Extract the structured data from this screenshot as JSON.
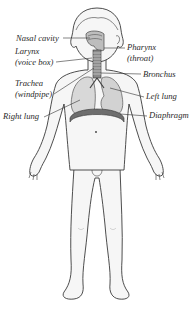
{
  "diagram": {
    "labels": {
      "nasal_cavity": "Nasal cavity",
      "larynx": "Larynx",
      "larynx_common": "(voice box)",
      "pharynx": "Pharynx",
      "pharynx_common": "(throat)",
      "bronchus": "Bronchus",
      "trachea": "Trachea",
      "trachea_common": "(windpipe)",
      "left_lung": "Left lung",
      "right_lung": "Right lung",
      "diaphragm": "Diaphragm"
    },
    "colors": {
      "outline": "#3a3a3a",
      "skin": "#f4f4f4",
      "lung": "#d6d6d6",
      "diaphragm": "#7a7a7a",
      "airway": "#555555",
      "leader": "#333333"
    }
  }
}
